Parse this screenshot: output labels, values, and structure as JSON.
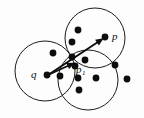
{
  "figure": {
    "background_color": "#fdfdfd",
    "stroke_color": "#1a1a1a",
    "point_color": "#0d0d0d",
    "width": 144,
    "height": 118
  },
  "circles": [
    {
      "name": "left-circle",
      "cx": 45,
      "cy": 71,
      "r": 30
    },
    {
      "name": "top-right-circle",
      "cx": 95,
      "cy": 38,
      "r": 30
    },
    {
      "name": "bottom-right-circle",
      "cx": 88,
      "cy": 80,
      "r": 30
    }
  ],
  "points": [
    {
      "name": "point-q",
      "cx": 47,
      "cy": 75,
      "r": 3.4
    },
    {
      "name": "point-p",
      "cx": 105,
      "cy": 37,
      "r": 3.4
    },
    {
      "name": "point-p1",
      "cx": 75,
      "cy": 66,
      "r": 3.4
    },
    {
      "name": "point-a",
      "cx": 78,
      "cy": 30,
      "r": 3.4
    },
    {
      "name": "point-b",
      "cx": 72,
      "cy": 42,
      "r": 3.4
    },
    {
      "name": "point-c",
      "cx": 53,
      "cy": 53,
      "r": 3.4
    },
    {
      "name": "point-d",
      "cx": 72,
      "cy": 57,
      "r": 3.4
    },
    {
      "name": "point-e",
      "cx": 85,
      "cy": 60,
      "r": 3.4
    },
    {
      "name": "point-f",
      "cx": 60,
      "cy": 76,
      "r": 3.4
    },
    {
      "name": "point-g",
      "cx": 78,
      "cy": 78,
      "r": 3.4
    },
    {
      "name": "point-h",
      "cx": 96,
      "cy": 78,
      "r": 3.4
    },
    {
      "name": "point-i",
      "cx": 79,
      "cy": 90,
      "r": 3.4
    },
    {
      "name": "point-j",
      "cx": 115,
      "cy": 65,
      "r": 3.4
    },
    {
      "name": "point-k",
      "cx": 127,
      "cy": 79,
      "r": 3.4
    }
  ],
  "vectors": [
    {
      "name": "vector-q-to-p",
      "x1": 48,
      "y1": 75,
      "x2": 101,
      "y2": 40,
      "head_angle_deg": -33.4
    },
    {
      "name": "vector-q-to-p1",
      "x1": 48,
      "y1": 75,
      "x2": 72,
      "y2": 64,
      "head_angle_deg": -24.6
    }
  ],
  "labels": [
    {
      "name": "label-p",
      "text": "p",
      "x": 112,
      "y": 40,
      "sub": ""
    },
    {
      "name": "label-q",
      "text": "q",
      "x": 31,
      "y": 78,
      "sub": ""
    },
    {
      "name": "label-p1",
      "text": "p",
      "x": 76,
      "y": 73,
      "sub": "1"
    }
  ]
}
